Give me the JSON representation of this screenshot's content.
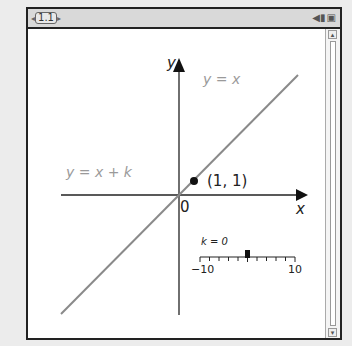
{
  "window": {
    "tab": {
      "label": "1.1",
      "prev": "◂",
      "next": "▸"
    },
    "icons": [
      "battery-icon",
      "doc-icon"
    ]
  },
  "graph": {
    "y_axis_label": "y",
    "x_axis_label": "x",
    "origin_label": "0",
    "line_ref_label": "y = x",
    "line_label": "y = x + k",
    "point_label": "(1, 1)",
    "line_color": "#8a8a8a",
    "label_color": "#9a9a9a"
  },
  "slider": {
    "label": "k = 0",
    "min_label": "−10",
    "max_label": "10",
    "value": 0,
    "min": -10,
    "max": 10
  },
  "scrollbar": {
    "up": "▴",
    "down": "▾"
  }
}
